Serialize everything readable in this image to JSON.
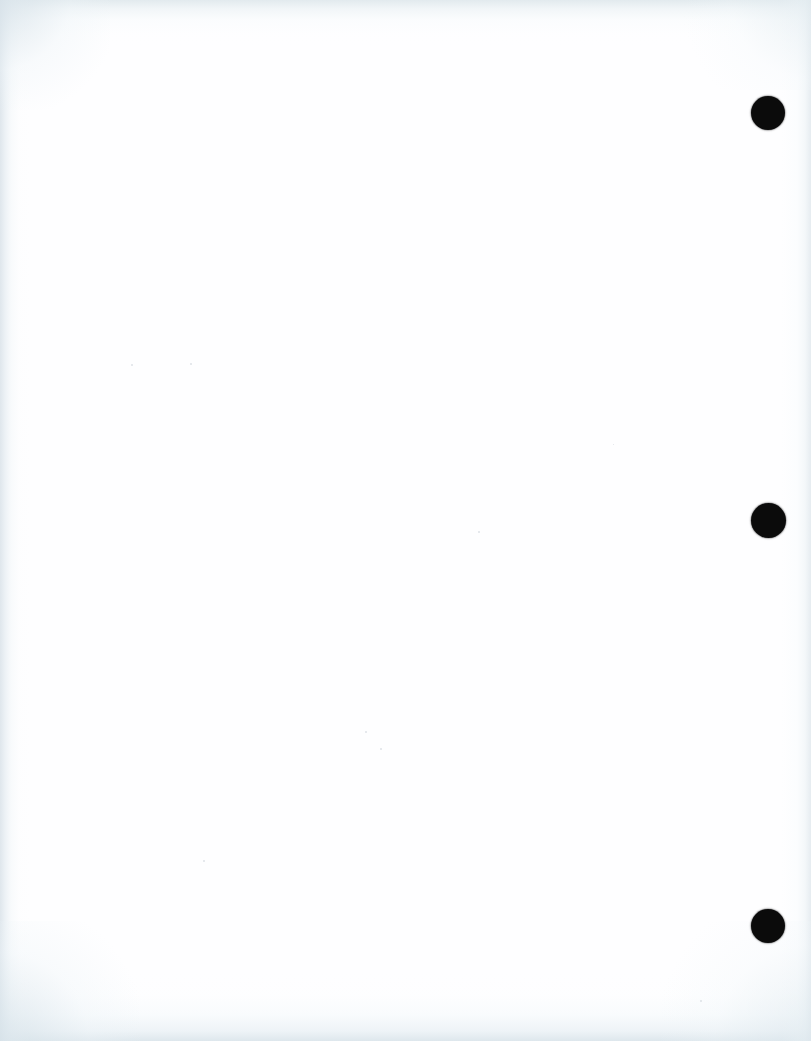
{
  "document": {
    "kind": "scanned-page",
    "page_label": "",
    "body_text": "",
    "width_px": 811,
    "height_px": 1041
  },
  "colors": {
    "paper": "#fefeff",
    "hole_punch": "#0b0b0b",
    "edge_shadow": "#dde5eb",
    "speck": "#c4ccd4"
  },
  "binding": {
    "label": "three-hole punch margin",
    "edge": "right",
    "hole_count": 3,
    "hole_diameter_px": 34,
    "holes": [
      {
        "name": "hole-punch-top",
        "center_x": 768,
        "center_y": 113,
        "diameter": 34
      },
      {
        "name": "hole-punch-middle",
        "center_x": 768,
        "center_y": 520,
        "diameter": 35
      },
      {
        "name": "hole-punch-bottom",
        "center_x": 768,
        "center_y": 926,
        "diameter": 34
      }
    ]
  },
  "edges": [
    {
      "name": "edge-shadow-left",
      "side": "left",
      "width_px": 30
    },
    {
      "name": "edge-shadow-right",
      "side": "right",
      "width_px": 32
    },
    {
      "name": "edge-shadow-top",
      "side": "top",
      "height_px": 46
    },
    {
      "name": "edge-shadow-bottom",
      "side": "bottom",
      "height_px": 70
    }
  ],
  "specks": [
    {
      "x": 190,
      "y": 363,
      "size": 2
    },
    {
      "x": 131,
      "y": 364,
      "size": 2
    },
    {
      "x": 478,
      "y": 531,
      "size": 2
    },
    {
      "x": 365,
      "y": 731,
      "size": 2
    },
    {
      "x": 380,
      "y": 748,
      "size": 2
    },
    {
      "x": 700,
      "y": 1000,
      "size": 2
    },
    {
      "x": 203,
      "y": 860,
      "size": 2
    },
    {
      "x": 613,
      "y": 444,
      "size": 1
    }
  ]
}
